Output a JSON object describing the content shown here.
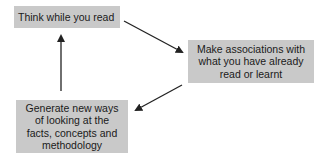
{
  "diagram": {
    "type": "cycle",
    "nodes": [
      {
        "id": "think",
        "label": "Think while you read"
      },
      {
        "id": "associate",
        "label": "Make associations with what you have already read or learnt"
      },
      {
        "id": "generate",
        "label": "Generate new ways of looking at the facts, concepts and methodology"
      }
    ],
    "edges": [
      {
        "from": "think",
        "to": "associate"
      },
      {
        "from": "associate",
        "to": "generate"
      },
      {
        "from": "generate",
        "to": "think"
      }
    ],
    "colors": {
      "box_fill": "#c9c9c9",
      "text": "#1a1a1a",
      "arrow": "#222222",
      "background": "#ffffff"
    }
  },
  "boxes": {
    "think": {
      "line1": "Think while you read"
    },
    "associate": {
      "line1": "Make associations with",
      "line2": "what you have already",
      "line3": "read or learnt"
    },
    "generate": {
      "line1": "Generate new ways",
      "line2": "of looking at the",
      "line3": "facts, concepts and",
      "line4": "methodology"
    }
  }
}
